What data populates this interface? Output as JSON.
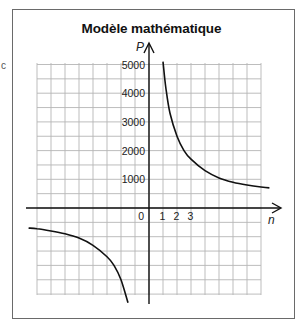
{
  "chart_data": {
    "type": "line",
    "title": "Modèle mathématique",
    "xlabel": "n",
    "ylabel": "P",
    "x_tick_labels": [
      "0",
      "1",
      "2",
      "3"
    ],
    "y_tick_labels": [
      "1000",
      "2000",
      "3000",
      "4000",
      "5000"
    ],
    "grid": true,
    "xlim": [
      -8.7,
      9.5
    ],
    "ylim": [
      -3400,
      5300
    ],
    "series": [
      {
        "name": "branche n > 0",
        "x": [
          1.0,
          1.2,
          1.5,
          2,
          2.5,
          3,
          4,
          5,
          6,
          7,
          8,
          8.6
        ],
        "y": [
          5100,
          4200,
          3300,
          2500,
          2000,
          1700,
          1300,
          1050,
          900,
          800,
          730,
          700
        ]
      },
      {
        "name": "branche n < 0",
        "x": [
          -8.6,
          -8,
          -7,
          -6,
          -5,
          -4,
          -3,
          -2.5,
          -2,
          -1.5
        ],
        "y": [
          -700,
          -720,
          -800,
          -900,
          -1050,
          -1300,
          -1700,
          -2000,
          -2500,
          -3300
        ]
      }
    ]
  },
  "figure": {
    "title": "Modèle mathématique",
    "edge_glyph": "c"
  }
}
